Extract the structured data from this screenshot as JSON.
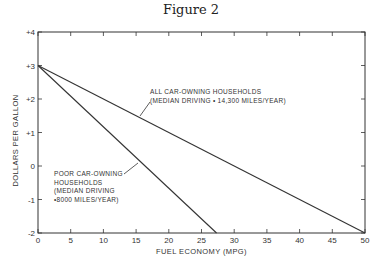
{
  "figure": {
    "title": "Figure 2"
  },
  "chart_data": {
    "type": "line",
    "title": "Figure 2",
    "xlabel": "FUEL ECONOMY (MPG)",
    "ylabel": "DOLLARS PER GALLON",
    "xlim": [
      0,
      50
    ],
    "ylim": [
      -2,
      4
    ],
    "xticks": [
      "0",
      "5",
      "10",
      "15",
      "20",
      "25",
      "30",
      "35",
      "40",
      "45",
      "50"
    ],
    "yticks": [
      "-2",
      "-1",
      "0",
      "+1",
      "+2",
      "+3",
      "+4"
    ],
    "grid": false,
    "series": [
      {
        "name": "All car-owning households (median driving = 14,300 miles/year)",
        "x": [
          0,
          50
        ],
        "y": [
          3,
          -2
        ]
      },
      {
        "name": "Poor car-owning households (median driving = 8000 miles/year)",
        "x": [
          0,
          27.3
        ],
        "y": [
          3,
          -2
        ]
      }
    ],
    "annotations": [
      {
        "text": "ALL CAR-OWNING HOUSEHOLDS\n(MEDIAN DRIVING = 14,300 MILES/YEAR)"
      },
      {
        "text": "POOR CAR-OWNING\nHOUSEHOLDS\n(MEDIAN DRIVING\n=8000 MILES/YEAR)"
      }
    ]
  },
  "labels": {
    "all_households": "ALL CAR-OWNING HOUSEHOLDS\n(MEDIAN DRIVING • 14,300 MILES/YEAR)",
    "poor_households": "POOR CAR-OWNING\nHOUSEHOLDS\n(MEDIAN DRIVING\n•8000 MILES/YEAR)"
  }
}
